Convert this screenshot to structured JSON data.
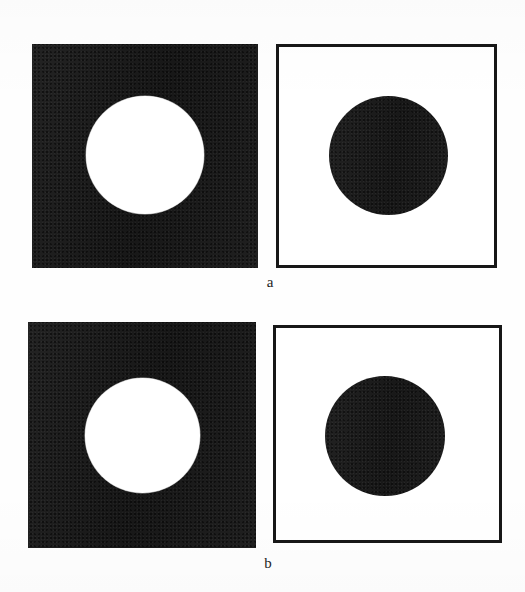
{
  "figure": {
    "background_color": "#fefefe",
    "ink_color": "#1b1b1b",
    "field_color": "#ffffff",
    "panels": [
      {
        "id": "a-left",
        "role": "opaque-screen-with-aperture",
        "field": "solid-black-square",
        "aperture": "white-disc",
        "x": 32,
        "y": 44,
        "width": 226,
        "height": 224,
        "disc_center_x": 145,
        "disc_center_y": 155,
        "disc_diameter": 118
      },
      {
        "id": "a-right",
        "role": "complementary-obstacle",
        "field": "outlined-white-square",
        "aperture": "black-disc",
        "x": 276,
        "y": 44,
        "width": 221,
        "height": 224,
        "disc_center_x": 388,
        "disc_center_y": 155,
        "disc_diameter": 119
      },
      {
        "id": "b-left",
        "role": "opaque-screen-with-aperture",
        "field": "solid-black-square",
        "aperture": "white-disc",
        "x": 28,
        "y": 322,
        "width": 228,
        "height": 226,
        "disc_center_x": 142,
        "disc_center_y": 435,
        "disc_diameter": 115
      },
      {
        "id": "b-right",
        "role": "complementary-obstacle",
        "field": "outlined-white-square",
        "aperture": "black-disc",
        "x": 273,
        "y": 325,
        "width": 229,
        "height": 218,
        "disc_center_x": 385,
        "disc_center_y": 436,
        "disc_diameter": 120
      }
    ],
    "captions": [
      {
        "id": "caption-a",
        "text": "a",
        "x": 270,
        "y": 275
      },
      {
        "id": "caption-b",
        "text": "b",
        "x": 268,
        "y": 556
      }
    ]
  }
}
